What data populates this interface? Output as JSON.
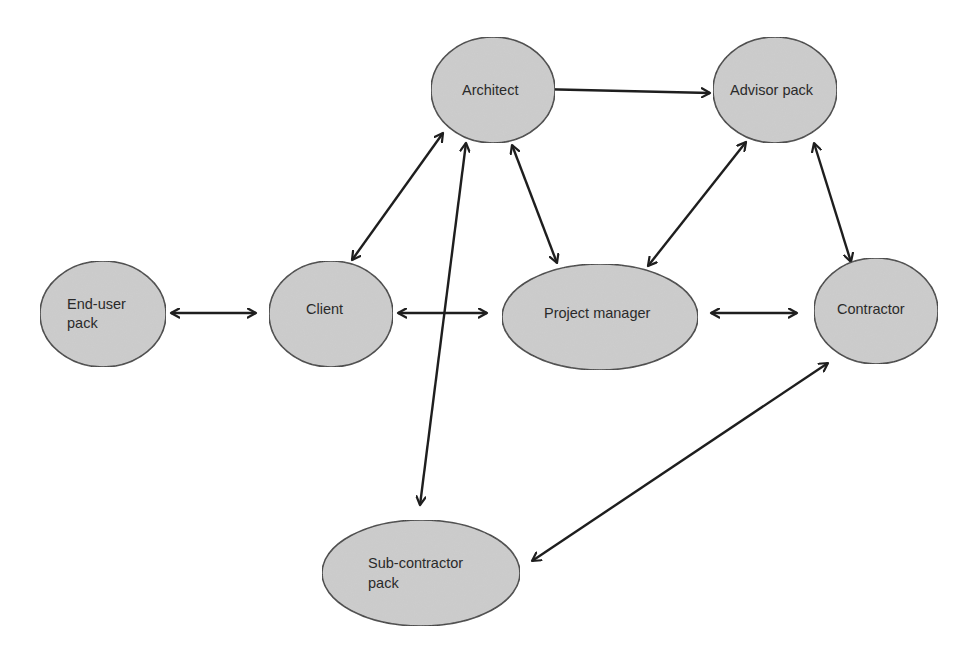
{
  "diagram": {
    "type": "relationship-network",
    "colors": {
      "node_fill": "#cdcdcd",
      "node_stroke": "#3a3a3a",
      "edge": "#1e1e1e",
      "text": "#2a2a2a",
      "background": "#ffffff"
    },
    "nodes": [
      {
        "id": "architect",
        "lines": [
          "Architect"
        ],
        "cx": 493,
        "cy": 90,
        "rx": 62,
        "ry": 53,
        "text_x": 462,
        "text_y": [
          95
        ]
      },
      {
        "id": "advisor-pack",
        "lines": [
          "Advisor pack"
        ],
        "cx": 775,
        "cy": 90,
        "rx": 62,
        "ry": 53,
        "text_x": 730,
        "text_y": [
          95
        ]
      },
      {
        "id": "end-user-pack",
        "lines": [
          "End-user",
          "pack"
        ],
        "cx": 103,
        "cy": 314,
        "rx": 63,
        "ry": 53,
        "text_x": 67,
        "text_y": [
          309,
          328
        ]
      },
      {
        "id": "client",
        "lines": [
          "Client"
        ],
        "cx": 331,
        "cy": 314,
        "rx": 62,
        "ry": 53,
        "text_x": 306,
        "text_y": [
          314
        ]
      },
      {
        "id": "project-manager",
        "lines": [
          "Project manager"
        ],
        "cx": 600,
        "cy": 317,
        "rx": 98,
        "ry": 53,
        "text_x": 544,
        "text_y": [
          318
        ]
      },
      {
        "id": "contractor",
        "lines": [
          "Contractor"
        ],
        "cx": 876,
        "cy": 311,
        "rx": 62,
        "ry": 53,
        "text_x": 837,
        "text_y": [
          314
        ]
      },
      {
        "id": "sub-contractor-pack",
        "lines": [
          "Sub-contractor",
          "pack"
        ],
        "cx": 421,
        "cy": 573,
        "rx": 99,
        "ry": 53,
        "text_x": 368,
        "text_y": [
          568,
          588
        ]
      }
    ],
    "edges": [
      {
        "from": "architect",
        "to": "advisor-pack",
        "x1": 537,
        "y1": 89,
        "x2": 710,
        "y2": 93,
        "bidirectional": true
      },
      {
        "from": "architect",
        "to": "client",
        "x1": 443,
        "y1": 133,
        "x2": 352,
        "y2": 260,
        "bidirectional": true
      },
      {
        "from": "architect",
        "to": "sub-contractor-pack",
        "x1": 466,
        "y1": 143,
        "x2": 420,
        "y2": 505,
        "bidirectional": true
      },
      {
        "from": "architect",
        "to": "project-manager",
        "x1": 512,
        "y1": 145,
        "x2": 557,
        "y2": 263,
        "bidirectional": true
      },
      {
        "from": "advisor-pack",
        "to": "project-manager",
        "x1": 746,
        "y1": 142,
        "x2": 648,
        "y2": 266,
        "bidirectional": true
      },
      {
        "from": "advisor-pack",
        "to": "contractor",
        "x1": 814,
        "y1": 143,
        "x2": 851,
        "y2": 262,
        "bidirectional": true
      },
      {
        "from": "end-user-pack",
        "to": "client",
        "x1": 171,
        "y1": 313,
        "x2": 256,
        "y2": 313,
        "bidirectional": true
      },
      {
        "from": "client",
        "to": "project-manager",
        "x1": 398,
        "y1": 313,
        "x2": 487,
        "y2": 313,
        "bidirectional": true
      },
      {
        "from": "project-manager",
        "to": "contractor",
        "x1": 711,
        "y1": 313,
        "x2": 797,
        "y2": 313,
        "bidirectional": true
      },
      {
        "from": "contractor",
        "to": "sub-contractor-pack",
        "x1": 828,
        "y1": 363,
        "x2": 532,
        "y2": 561,
        "bidirectional": true
      }
    ]
  }
}
